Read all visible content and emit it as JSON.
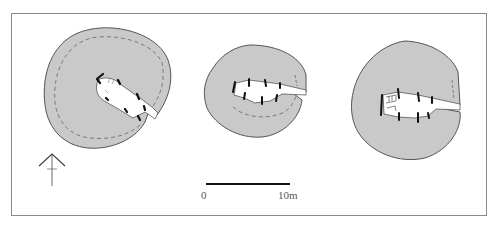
{
  "figure": {
    "type": "archaeological site plans",
    "structures": [
      {
        "id": "structure-1",
        "shape": "roughly circular mound with inner dashed wall line and NW-SE passage opening SE"
      },
      {
        "id": "structure-2",
        "shape": "oval mound with straight passage opening east, dashed inner line on south"
      },
      {
        "id": "structure-3",
        "shape": "irregular circular mound with passage opening east, steps at chamber end"
      }
    ]
  },
  "north_arrow": {
    "icon": "north-arrow-icon"
  },
  "scale_bar": {
    "start_label": "0",
    "end_label": "10m"
  },
  "colors": {
    "mound_fill": "#c9c9c9",
    "outline": "#555555",
    "passage_fill": "#ffffff",
    "stone_marks": "#111111",
    "frame_border": "#8a8a8a"
  }
}
